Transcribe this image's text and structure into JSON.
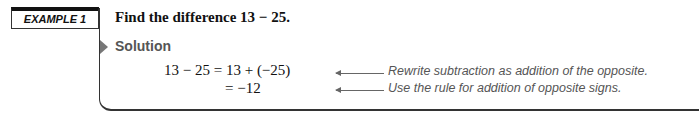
{
  "example": {
    "label": "EXAMPLE 1",
    "title": "Find the difference 13 − 25.",
    "solution_label": "Solution",
    "steps": [
      {
        "expression": "13 − 25 = 13 + (−25)",
        "note": "Rewrite subtraction as addition of the opposite."
      },
      {
        "expression": "= −12",
        "note": "Use the rule for addition of opposite signs."
      }
    ]
  },
  "colors": {
    "frame": "#333333",
    "solution_accent": "#777777",
    "note_text": "#555555"
  }
}
